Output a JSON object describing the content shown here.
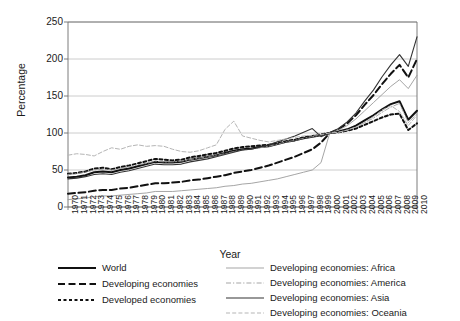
{
  "chart_data": {
    "type": "line",
    "title": "",
    "xlabel": "Year",
    "ylabel": "Percentage",
    "xlim": [
      1970,
      2010
    ],
    "ylim": [
      0,
      250
    ],
    "ytick_labels": [
      "0",
      "50",
      "100",
      "150",
      "200",
      "250"
    ],
    "yticks": [
      0,
      50,
      100,
      150,
      200,
      250
    ],
    "grid": "horizontal",
    "legend_position": "below-plot",
    "x": [
      1970,
      1971,
      1972,
      1973,
      1974,
      1975,
      1976,
      1977,
      1978,
      1979,
      1980,
      1981,
      1982,
      1983,
      1984,
      1985,
      1986,
      1987,
      1988,
      1989,
      1990,
      1991,
      1992,
      1993,
      1994,
      1995,
      1996,
      1997,
      1998,
      1999,
      2000,
      2001,
      2002,
      2003,
      2004,
      2005,
      2006,
      2007,
      2008,
      2009,
      2010
    ],
    "tick_labels": [
      "1970",
      "1971",
      "1972",
      "1973",
      "1974",
      "1975",
      "1976",
      "1977",
      "1978",
      "1979",
      "1980",
      "1981",
      "1982",
      "1983",
      "1984",
      "1985",
      "1986",
      "1987",
      "1988",
      "1989",
      "1990",
      "1991",
      "1992",
      "1993",
      "1994",
      "1995",
      "1996",
      "1997",
      "1998",
      "1999",
      "2000",
      "2001",
      "2002",
      "2003",
      "2004",
      "2005",
      "2006",
      "2007",
      "2008",
      "2009",
      "2010"
    ],
    "series": [
      {
        "name": "World",
        "style": "solid-thick-black",
        "color": "#111111",
        "values": [
          40,
          41,
          43,
          47,
          48,
          47,
          50,
          52,
          55,
          58,
          61,
          60,
          60,
          61,
          64,
          66,
          68,
          70,
          73,
          76,
          78,
          79,
          81,
          82,
          85,
          88,
          90,
          93,
          95,
          97,
          100,
          102,
          105,
          110,
          117,
          124,
          132,
          139,
          143,
          118,
          130
        ]
      },
      {
        "name": "Developing economies",
        "style": "dashed-thick-black",
        "color": "#111111",
        "values": [
          18,
          19,
          20,
          22,
          23,
          23,
          25,
          26,
          28,
          30,
          32,
          32,
          33,
          34,
          36,
          37,
          39,
          41,
          43,
          46,
          48,
          50,
          53,
          56,
          60,
          64,
          68,
          73,
          78,
          87,
          100,
          105,
          113,
          124,
          138,
          151,
          166,
          180,
          192,
          175,
          200
        ]
      },
      {
        "name": "Developed economies",
        "style": "dotted-thick-black",
        "color": "#111111",
        "values": [
          45,
          46,
          48,
          52,
          53,
          51,
          54,
          56,
          59,
          62,
          65,
          64,
          63,
          64,
          67,
          69,
          71,
          73,
          76,
          79,
          81,
          82,
          83,
          84,
          86,
          89,
          91,
          94,
          96,
          98,
          100,
          101,
          103,
          106,
          111,
          116,
          121,
          125,
          126,
          104,
          113
        ]
      },
      {
        "name": "Developing economies: Africa",
        "style": "solid-thin-grey",
        "color": "#9b9b9b",
        "values": [
          10,
          11,
          12,
          14,
          15,
          15,
          16,
          17,
          18,
          19,
          21,
          21,
          21,
          22,
          23,
          24,
          25,
          26,
          28,
          29,
          31,
          32,
          34,
          36,
          38,
          41,
          44,
          47,
          50,
          60,
          100,
          104,
          110,
          119,
          130,
          141,
          152,
          163,
          172,
          160,
          178
        ]
      },
      {
        "name": "Developing economies: America",
        "style": "dashdot-thin-grey",
        "color": "#9b9b9b",
        "values": [
          44,
          45,
          47,
          50,
          51,
          50,
          52,
          54,
          57,
          59,
          62,
          61,
          61,
          62,
          64,
          66,
          68,
          70,
          72,
          75,
          77,
          78,
          80,
          82,
          85,
          88,
          90,
          93,
          95,
          97,
          100,
          101,
          104,
          108,
          114,
          120,
          128,
          135,
          140,
          114,
          126
        ]
      },
      {
        "name": "Developing economies: Asia",
        "style": "solid-thin-black",
        "color": "#333333",
        "values": [
          38,
          39,
          41,
          44,
          45,
          44,
          47,
          49,
          52,
          55,
          58,
          57,
          57,
          58,
          61,
          63,
          65,
          68,
          71,
          74,
          77,
          78,
          81,
          84,
          88,
          92,
          96,
          101,
          106,
          95,
          100,
          106,
          115,
          127,
          143,
          158,
          176,
          192,
          206,
          190,
          230
        ]
      },
      {
        "name": "Developing economies: Oceania",
        "style": "dashed-thin-lightgrey",
        "color": "#b5b5b5",
        "values": [
          70,
          72,
          71,
          69,
          75,
          80,
          78,
          82,
          84,
          82,
          83,
          82,
          78,
          75,
          74,
          76,
          80,
          84,
          105,
          116,
          96,
          93,
          90,
          88,
          90,
          92,
          94,
          96,
          97,
          98,
          100,
          101,
          104,
          108,
          114,
          122,
          131,
          137,
          129,
          110,
          124
        ]
      }
    ]
  },
  "axis": {
    "y_title": "Percentage",
    "x_title": "Year"
  },
  "legend": {
    "left_items": [
      {
        "label": "World",
        "swatch": "solid-thick-black"
      },
      {
        "label": "Developing economies",
        "swatch": "dashed-thick-black"
      },
      {
        "label": "Developed economies",
        "swatch": "dotted-thick-black"
      }
    ],
    "right_items": [
      {
        "label": "Developing economies: Africa",
        "swatch": "solid-thin-grey"
      },
      {
        "label": "Developing economies: America",
        "swatch": "dashdot-thin-grey"
      },
      {
        "label": "Developing economies: Asia",
        "swatch": "solid-thin-black"
      },
      {
        "label": "Developing economies: Oceania",
        "swatch": "dashed-thin-lightgrey"
      }
    ]
  },
  "colors": {
    "gridline": "#bfbfbf",
    "axis": "#6e6e6e",
    "text": "#1a1a1a"
  }
}
